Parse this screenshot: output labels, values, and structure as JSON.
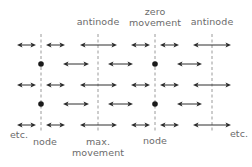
{
  "diagram": {
    "title": "",
    "colors": {
      "line": "#9a9a9a",
      "arrow": "#2e2e2e",
      "dot": "#1a1a1a",
      "text": "#6b6b6b",
      "background": "#ffffff"
    },
    "top_labels": [
      {
        "id": "antinode-1",
        "lines": [
          "antinode"
        ],
        "x": 98
      },
      {
        "id": "zero-movement",
        "lines": [
          "zero",
          "movement"
        ],
        "x": 155
      },
      {
        "id": "antinode-2",
        "lines": [
          "antinode"
        ],
        "x": 212
      }
    ],
    "bottom_labels": [
      {
        "id": "etc-left",
        "text": "etc.",
        "x": 19,
        "y": 131
      },
      {
        "id": "node-1",
        "text": "node",
        "x": 44,
        "y": 137
      },
      {
        "id": "max-movement-1",
        "text": "max.",
        "x": 98,
        "y": 137
      },
      {
        "id": "max-movement-2",
        "text": "movement",
        "x": 98,
        "y": 147
      },
      {
        "id": "node-2",
        "text": "node",
        "x": 155,
        "y": 136
      },
      {
        "id": "etc-right",
        "text": "etc.",
        "x": 239,
        "y": 130
      }
    ],
    "dashed_lines": [
      {
        "x": 41,
        "y1": 34,
        "y2": 133,
        "type": "node"
      },
      {
        "x": 98,
        "y1": 34,
        "y2": 133,
        "type": "antinode"
      },
      {
        "x": 155,
        "y1": 34,
        "y2": 133,
        "type": "node"
      },
      {
        "x": 212,
        "y1": 34,
        "y2": 132,
        "type": "antinode"
      }
    ],
    "rows": [
      {
        "y": 45,
        "kind": "wide",
        "arrows": [
          [
            17,
            36
          ],
          [
            46,
            65
          ],
          [
            80,
            117
          ],
          [
            131,
            150
          ],
          [
            160,
            179
          ],
          [
            193,
            231
          ]
        ],
        "dots": []
      },
      {
        "y": 64,
        "kind": "narrow",
        "arrows": [
          [
            63,
            89
          ],
          [
            108,
            133
          ],
          [
            177,
            202
          ]
        ],
        "dots": [
          41,
          155
        ]
      },
      {
        "y": 85,
        "kind": "wide",
        "arrows": [
          [
            17,
            36
          ],
          [
            46,
            65
          ],
          [
            80,
            117
          ],
          [
            131,
            150
          ],
          [
            160,
            179
          ],
          [
            193,
            231
          ]
        ],
        "dots": []
      },
      {
        "y": 104,
        "kind": "narrow",
        "arrows": [
          [
            63,
            89
          ],
          [
            108,
            133
          ],
          [
            177,
            202
          ]
        ],
        "dots": [
          41,
          155
        ]
      },
      {
        "y": 125,
        "kind": "wide",
        "arrows": [
          [
            17,
            36
          ],
          [
            46,
            65
          ],
          [
            80,
            117
          ],
          [
            131,
            150
          ],
          [
            160,
            179
          ],
          [
            193,
            231
          ]
        ],
        "dots": []
      }
    ]
  }
}
